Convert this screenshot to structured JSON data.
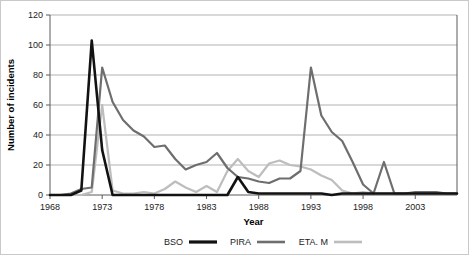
{
  "chart_data": {
    "type": "line",
    "title": "",
    "xlabel": "Year",
    "ylabel": "Number of incidents",
    "xlim": [
      1968,
      2007
    ],
    "ylim": [
      0,
      120
    ],
    "yticks": [
      0,
      20,
      40,
      60,
      80,
      100,
      120
    ],
    "xticks": [
      1968,
      1973,
      1978,
      1983,
      1988,
      1993,
      1998,
      2003
    ],
    "grid": "horizontal",
    "legend_position": "bottom",
    "x": [
      1968,
      1969,
      1970,
      1971,
      1972,
      1973,
      1974,
      1975,
      1976,
      1977,
      1978,
      1979,
      1980,
      1981,
      1982,
      1983,
      1984,
      1985,
      1986,
      1987,
      1988,
      1989,
      1990,
      1991,
      1992,
      1993,
      1994,
      1995,
      1996,
      1997,
      1998,
      1999,
      2000,
      2001,
      2002,
      2003,
      2004,
      2005,
      2006,
      2007
    ],
    "series": [
      {
        "name": "BSO",
        "color": "#121212",
        "width": 2.6,
        "values": [
          0,
          0,
          0,
          3,
          103,
          30,
          0,
          0,
          0,
          0,
          0,
          0,
          0,
          0,
          0,
          0,
          0,
          0,
          12,
          2,
          1,
          1,
          1,
          1,
          1,
          1,
          1,
          0,
          1,
          1,
          1,
          1,
          1,
          1,
          1,
          1,
          1,
          1,
          1,
          1
        ]
      },
      {
        "name": "PIRA",
        "color": "#6e6e6e",
        "width": 2.2,
        "values": [
          0,
          0,
          1,
          4,
          5,
          85,
          62,
          50,
          43,
          39,
          32,
          33,
          24,
          17,
          20,
          22,
          28,
          18,
          12,
          11,
          9,
          8,
          11,
          11,
          16,
          85,
          53,
          42,
          36,
          22,
          7,
          1,
          22,
          1,
          1,
          2,
          2,
          2,
          1,
          1
        ]
      },
      {
        "name": "ETA. M",
        "color": "#bdbdbd",
        "width": 2.2,
        "values": [
          0,
          0,
          0,
          0,
          2,
          60,
          3,
          1,
          1,
          2,
          1,
          4,
          9,
          5,
          2,
          6,
          2,
          16,
          24,
          16,
          12,
          21,
          23,
          20,
          19,
          17,
          13,
          10,
          3,
          1,
          2,
          1,
          1,
          1,
          1,
          1,
          1,
          1,
          1,
          1
        ]
      }
    ]
  },
  "legend": {
    "items": [
      {
        "label": "BSO",
        "color": "#121212",
        "width": 3.2
      },
      {
        "label": "PIRA",
        "color": "#6e6e6e",
        "width": 2.6
      },
      {
        "label": "ETA. M",
        "color": "#bdbdbd",
        "width": 2.6
      }
    ]
  }
}
